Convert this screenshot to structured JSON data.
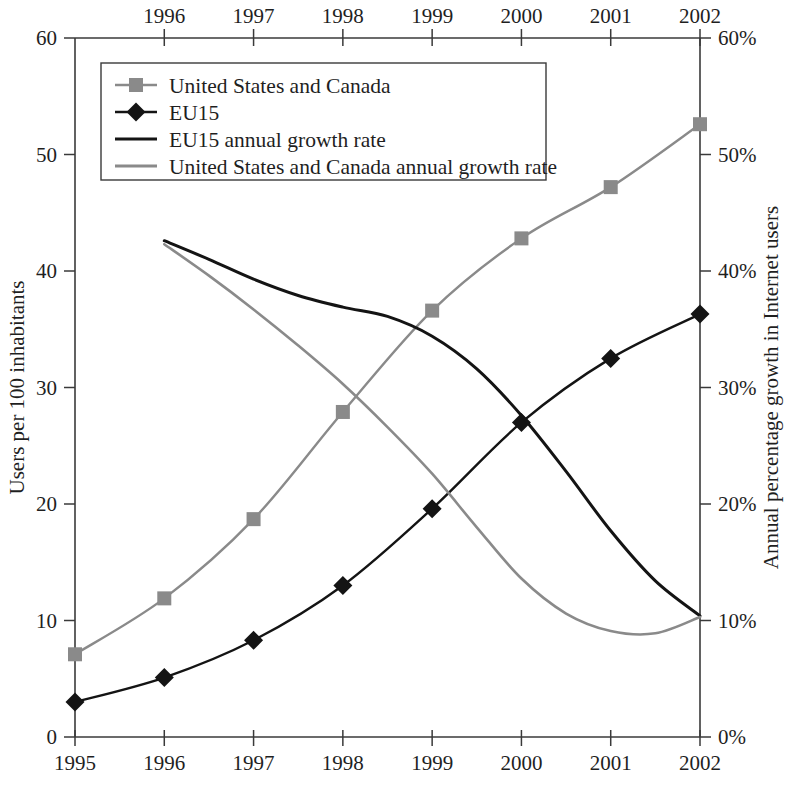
{
  "chart_data": {
    "type": "line",
    "title": "",
    "grid": false,
    "legend_position": "top-left",
    "axes": {
      "x_bottom": {
        "label": "",
        "ticks": [
          "1995",
          "1996",
          "1997",
          "1998",
          "1999",
          "2000",
          "2001",
          "2002"
        ],
        "min": 1995,
        "max": 2002
      },
      "x_top": {
        "label": "",
        "ticks": [
          "1996",
          "1997",
          "1998",
          "1999",
          "2000",
          "2001",
          "2002"
        ],
        "min": 1995,
        "max": 2002
      },
      "y_left": {
        "label": "Users per 100 inhabitants",
        "ticks": [
          "0",
          "10",
          "20",
          "30",
          "40",
          "50",
          "60"
        ],
        "min": 0,
        "max": 60
      },
      "y_right": {
        "label": "Annual percentage growth in Internet users",
        "ticks": [
          "0%",
          "10%",
          "20%",
          "30%",
          "40%",
          "50%",
          "60%"
        ],
        "min": 0,
        "max": 60
      }
    },
    "colors": {
      "us_canada": "#8a8a8a",
      "eu15": "#141414",
      "eu15_growth": "#141414",
      "us_canada_growth": "#8a8a8a",
      "axis": "#3a3a3a"
    },
    "series": [
      {
        "name": "United States and Canada",
        "legend_label": "United States and Canada",
        "marker": "square",
        "color": "#8a8a8a",
        "axis": "left",
        "x": [
          1995,
          1996,
          1997,
          1998,
          1999,
          2000,
          2001,
          2002
        ],
        "values": [
          7.1,
          11.9,
          18.7,
          27.9,
          36.6,
          42.8,
          47.2,
          52.6
        ]
      },
      {
        "name": "EU15",
        "legend_label": "EU15",
        "marker": "diamond",
        "color": "#141414",
        "axis": "left",
        "x": [
          1995,
          1996,
          1997,
          1998,
          1999,
          2000,
          2001,
          2002
        ],
        "values": [
          3.0,
          5.1,
          8.3,
          13.0,
          19.6,
          27.0,
          32.5,
          36.3
        ]
      },
      {
        "name": "EU15 annual growth rate",
        "legend_label": "EU15 annual growth rate",
        "marker": "none",
        "color": "#141414",
        "axis": "right",
        "x": [
          1996,
          1996.5,
          1997,
          1997.5,
          1998,
          1998.5,
          1999,
          1999.5,
          2000,
          2000.5,
          2001,
          2001.5,
          2002
        ],
        "values": [
          42.6,
          41.0,
          39.3,
          37.9,
          36.9,
          36.1,
          34.4,
          31.6,
          27.6,
          22.8,
          17.7,
          13.4,
          10.4
        ]
      },
      {
        "name": "United States and Canada annual growth rate",
        "legend_label": "United States and Canada annual growth rate",
        "marker": "none",
        "color": "#8a8a8a",
        "axis": "right",
        "x": [
          1996,
          1996.5,
          1997,
          1997.5,
          1998,
          1998.5,
          1999,
          1999.5,
          2000,
          2000.5,
          2001,
          2001.5,
          2002
        ],
        "values": [
          42.3,
          39.6,
          36.7,
          33.6,
          30.3,
          26.6,
          22.6,
          18.0,
          13.6,
          10.6,
          9.1,
          8.9,
          10.3
        ]
      }
    ]
  },
  "legend": {
    "items": [
      {
        "label": "United States and Canada",
        "marker": "square",
        "color": "#8a8a8a"
      },
      {
        "label": "EU15",
        "marker": "diamond",
        "color": "#141414"
      },
      {
        "label": "EU15 annual growth rate",
        "marker": "line",
        "color": "#141414"
      },
      {
        "label": "United States and Canada annual growth rate",
        "marker": "line",
        "color": "#8a8a8a"
      }
    ]
  }
}
